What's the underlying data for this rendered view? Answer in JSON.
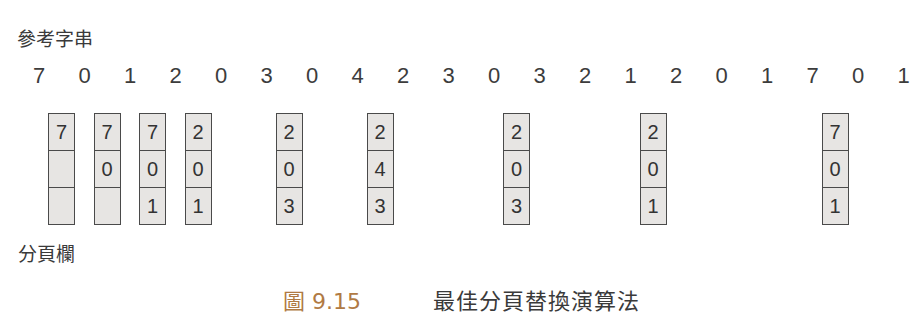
{
  "labels": {
    "reference_string": "參考字串",
    "page_frames": "分頁欄"
  },
  "reference_string": [
    "7",
    "0",
    "1",
    "2",
    "0",
    "3",
    "0",
    "4",
    "2",
    "3",
    "0",
    "3",
    "2",
    "1",
    "2",
    "0",
    "1",
    "7",
    "0",
    "1"
  ],
  "frames": [
    {
      "ref_index": 0,
      "cells": [
        "7",
        "",
        ""
      ]
    },
    {
      "ref_index": 1,
      "cells": [
        "7",
        "0",
        ""
      ]
    },
    {
      "ref_index": 2,
      "cells": [
        "7",
        "0",
        "1"
      ]
    },
    {
      "ref_index": 3,
      "cells": [
        "2",
        "0",
        "1"
      ]
    },
    {
      "ref_index": 5,
      "cells": [
        "2",
        "0",
        "3"
      ]
    },
    {
      "ref_index": 7,
      "cells": [
        "2",
        "4",
        "3"
      ]
    },
    {
      "ref_index": 10,
      "cells": [
        "2",
        "0",
        "3"
      ]
    },
    {
      "ref_index": 13,
      "cells": [
        "2",
        "0",
        "1"
      ]
    },
    {
      "ref_index": 17,
      "cells": [
        "7",
        "0",
        "1"
      ]
    }
  ],
  "caption": {
    "figure_number": "圖 9.15",
    "title": "最佳分頁替換演算法"
  },
  "colors": {
    "frame_fill": "#e7e5e3",
    "frame_border": "#4a4a4a",
    "text": "#333333",
    "caption_accent": "#b07a44"
  }
}
